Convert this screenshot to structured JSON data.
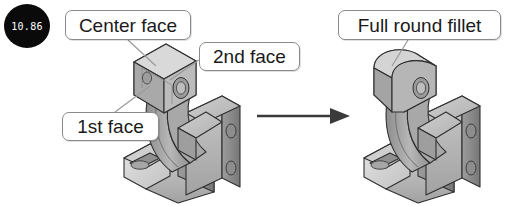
{
  "figure": {
    "name": "full-round-fillet-cad-illustration",
    "badge": {
      "value": "10.86",
      "shape": "circle",
      "background": "#0a0a0a",
      "text_color": "#ffffff"
    },
    "callouts": [
      {
        "id": "center-face",
        "label": "Center face"
      },
      {
        "id": "second-face",
        "label": "2nd face"
      },
      {
        "id": "first-face",
        "label": "1st face"
      },
      {
        "id": "full-round",
        "label": "Full round fillet"
      }
    ],
    "arrow": {
      "name": "transformation-arrow",
      "direction": "right",
      "color": "#3a3a3a"
    },
    "models": [
      {
        "id": "before-model",
        "name": "bracket-before-fillet",
        "description": "Isometric CAD bracket with three highlighted faces before full round fillet"
      },
      {
        "id": "after-model",
        "name": "bracket-after-fillet",
        "description": "Isometric CAD bracket after full round fillet applied"
      }
    ],
    "colors": {
      "callout_border": "#8a8a8a",
      "callout_fill": "#ffffff",
      "leader_line": "#9a9a9a",
      "model_light": "#d6d6d6",
      "model_mid": "#b4b4b4",
      "model_dark": "#8e8e8e",
      "model_darker": "#6f6f6f",
      "model_outline": "#2f2f2f"
    }
  }
}
